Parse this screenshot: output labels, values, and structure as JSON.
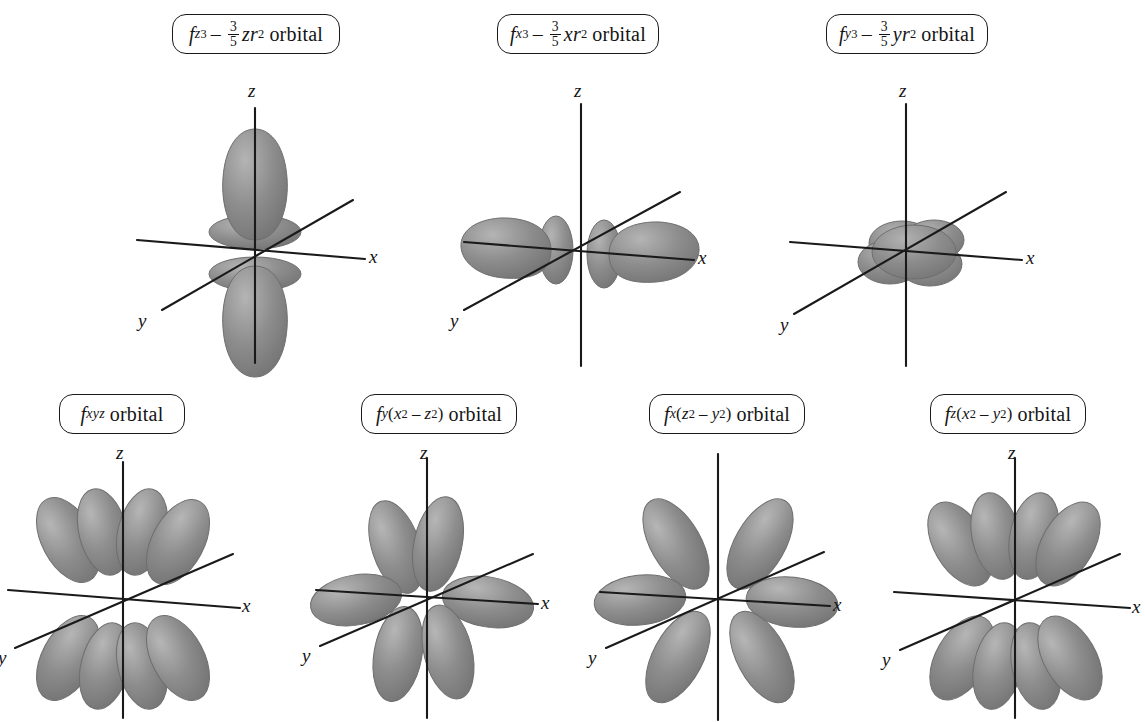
{
  "figure": {
    "background_color": "#ffffff",
    "lobe_color": "#8a8a8a",
    "lobe_edge_color": "#6e6e6e",
    "axis_color": "#1a1a1a",
    "label_border_color": "#1a1a1a",
    "text_color": "#141414"
  },
  "axis_labels": {
    "x": "x",
    "y": "y",
    "z": "z"
  },
  "orbitals": [
    {
      "id": "fz3",
      "label_plain": "fz3 – 3/5 zr2 orbital",
      "f": "f",
      "sub": "z",
      "sub_sup": "3",
      "minus": "–",
      "frac_num": "3",
      "frac_den": "5",
      "term": "zr",
      "term_sup": "2",
      "orbital_word": "orbital",
      "row": 1,
      "column": 1,
      "lobes": 2,
      "has_torus": true,
      "description": "two large lobes along z with two doughnut collars"
    },
    {
      "id": "fx3",
      "label_plain": "fx3 – 3/5 xr2 orbital",
      "f": "f",
      "sub": "x",
      "sub_sup": "3",
      "minus": "–",
      "frac_num": "3",
      "frac_den": "5",
      "term": "xr",
      "term_sup": "2",
      "orbital_word": "orbital",
      "row": 1,
      "column": 2,
      "lobes": 2,
      "has_torus": true,
      "description": "two large lobes along x with two collars"
    },
    {
      "id": "fy3",
      "label_plain": "fy3 – 3/5 yr2 orbital",
      "f": "f",
      "sub": "y",
      "sub_sup": "3",
      "minus": "–",
      "frac_num": "3",
      "frac_den": "5",
      "term": "yr",
      "term_sup": "2",
      "orbital_word": "orbital",
      "row": 1,
      "column": 3,
      "lobes": 2,
      "has_torus": true,
      "description": "lobes along y pointing into the page, foreshortened blob"
    },
    {
      "id": "fxyz",
      "label_plain": "fxyz orbital",
      "f": "f",
      "sub": "xyz",
      "orbital_word": "orbital",
      "row": 2,
      "column": 1,
      "lobes": 8,
      "has_torus": false,
      "description": "eight lobes pointing to cube corners"
    },
    {
      "id": "fy_x2_z2",
      "label_plain": "fy(x2 – z2) orbital",
      "f": "f",
      "sub": "y",
      "paren_open": "(",
      "t1": "x",
      "t1_sup": "2",
      "minus": "–",
      "t2": "z",
      "t2_sup": "2",
      "paren_close": ")",
      "orbital_word": "orbital",
      "row": 2,
      "column": 2,
      "lobes": 6,
      "has_torus": false,
      "description": "six-lobed rosette"
    },
    {
      "id": "fx_z2_y2",
      "label_plain": "fx(z2 – y2) orbital",
      "f": "f",
      "sub": "x",
      "paren_open": "(",
      "t1": "z",
      "t1_sup": "2",
      "minus": "–",
      "t2": "y",
      "t2_sup": "2",
      "paren_close": ")",
      "orbital_word": "orbital",
      "row": 2,
      "column": 3,
      "lobes": 6,
      "has_torus": false,
      "description": "six-lobed rosette in the xz style"
    },
    {
      "id": "fz_x2_y2",
      "label_plain": "fz(x2 – y2) orbital",
      "f": "f",
      "sub": "z",
      "paren_open": "(",
      "t1": "x",
      "t1_sup": "2",
      "minus": "–",
      "t2": "y",
      "t2_sup": "2",
      "paren_close": ")",
      "orbital_word": "orbital",
      "row": 2,
      "column": 4,
      "lobes": 8,
      "has_torus": false,
      "description": "eight lobes, four up four down"
    }
  ]
}
